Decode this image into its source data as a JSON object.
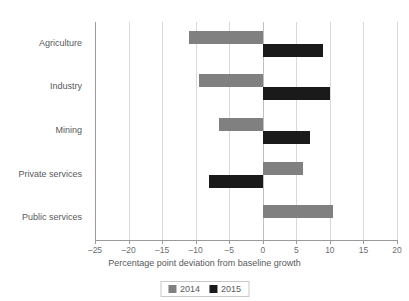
{
  "chart_data": {
    "type": "bar",
    "orientation": "horizontal",
    "title": "",
    "xlabel": "Percentage point deviation from baseline growth",
    "ylabel": "",
    "categories": [
      "Agriculture",
      "Industry",
      "Mining",
      "Private services",
      "Public services"
    ],
    "series": [
      {
        "name": "2014",
        "color": "#808080",
        "values": [
          -11.0,
          -9.5,
          -6.5,
          6.0,
          10.5
        ]
      },
      {
        "name": "2015",
        "color": "#1a1a1a",
        "values": [
          9.0,
          10.0,
          7.0,
          -8.0,
          0.0
        ]
      }
    ],
    "xlim": [
      -25,
      20
    ],
    "xticks": [
      -25,
      -20,
      -15,
      -10,
      -5,
      0,
      5,
      10,
      15,
      20
    ],
    "xticklabels": [
      "–25",
      "–20",
      "–15",
      "–10",
      "–5",
      "0",
      "5",
      "10",
      "15",
      "20"
    ],
    "grid": true,
    "legend_position": "bottom"
  },
  "legend": {
    "entries": [
      {
        "label": "2014"
      },
      {
        "label": "2015"
      }
    ]
  },
  "colors": {
    "series_2014": "#808080",
    "series_2015": "#1a1a1a",
    "gridline": "#d9d9d9",
    "axis": "#9a9a9a",
    "text": "#58595b"
  }
}
